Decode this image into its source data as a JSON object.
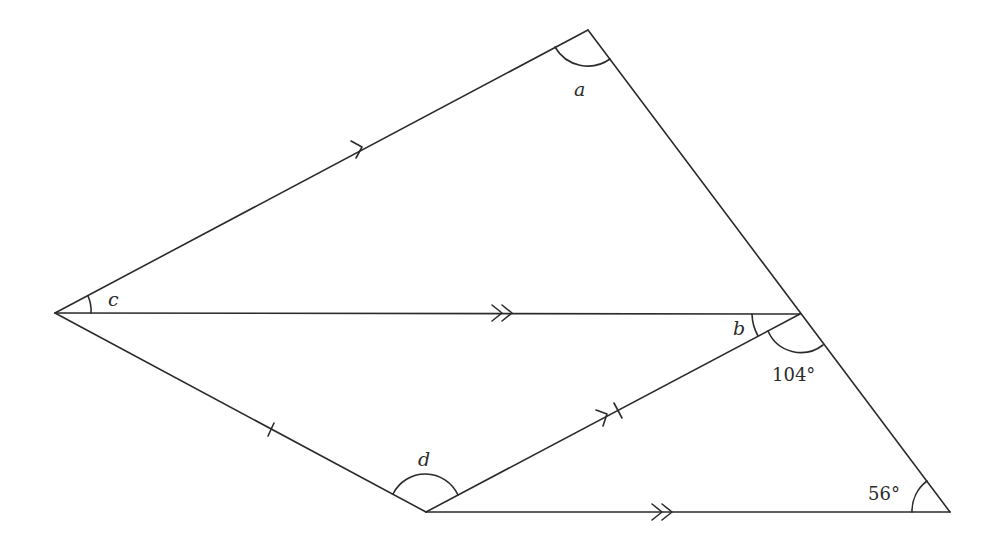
{
  "diagram": {
    "type": "geometry",
    "vertices": {
      "top": [
        588,
        30
      ],
      "left": [
        55,
        313
      ],
      "mid_right": [
        800,
        314
      ],
      "bottom": [
        426,
        512
      ],
      "bottom_right": [
        950,
        512
      ]
    },
    "labels": {
      "a": "a",
      "b": "b",
      "c": "c",
      "d": "d",
      "angle_104": "104°",
      "angle_56": "56°"
    },
    "marks": {
      "single_arrow": "parallel-single",
      "double_arrow": "parallel-double",
      "tick": "equal-length"
    }
  }
}
